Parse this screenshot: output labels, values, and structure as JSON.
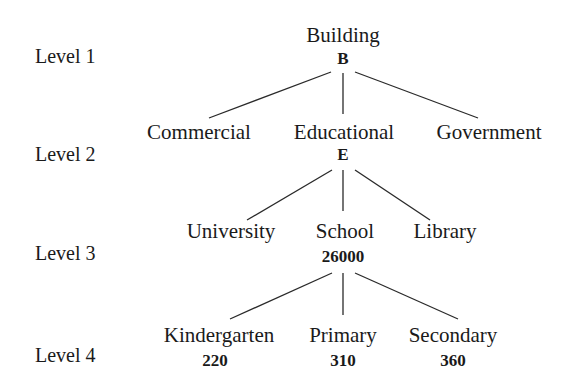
{
  "levels": [
    "Level 1",
    "Level 2",
    "Level 3",
    "Level 4"
  ],
  "tree": {
    "root": {
      "label": "Building",
      "code": "B"
    },
    "level2": [
      {
        "label": "Commercial"
      },
      {
        "label": "Educational",
        "code": "E"
      },
      {
        "label": "Government"
      }
    ],
    "level3": [
      {
        "label": "University"
      },
      {
        "label": "School",
        "code": "26000"
      },
      {
        "label": "Library"
      }
    ],
    "level4": [
      {
        "label": "Kindergarten",
        "code": "220"
      },
      {
        "label": "Primary",
        "code": "310"
      },
      {
        "label": "Secondary",
        "code": "360"
      }
    ]
  },
  "edges": [
    {
      "from": "Building",
      "to": "Commercial"
    },
    {
      "from": "Building",
      "to": "Educational"
    },
    {
      "from": "Building",
      "to": "Government"
    },
    {
      "from": "Educational",
      "to": "University"
    },
    {
      "from": "Educational",
      "to": "School"
    },
    {
      "from": "Educational",
      "to": "Library"
    },
    {
      "from": "School",
      "to": "Kindergarten"
    },
    {
      "from": "School",
      "to": "Primary"
    },
    {
      "from": "School",
      "to": "Secondary"
    }
  ]
}
